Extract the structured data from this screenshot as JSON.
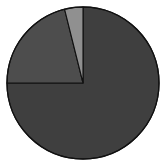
{
  "chart_data": {
    "type": "pie",
    "title": "",
    "subtitle": "",
    "xlabel": "",
    "ylabel": "",
    "grid": false,
    "legend": "none",
    "labels": [
      "Slice 1",
      "Slice 2",
      "Slice 3"
    ],
    "values": [
      75,
      21,
      4
    ],
    "percentages": [
      "75%",
      "21%",
      "4%"
    ],
    "colors": [
      "#3f3f3f",
      "#4d4d4d",
      "#909090"
    ],
    "start_angle_deg": 180,
    "direction": "clockwise",
    "slices": [
      {
        "name": "Slice 1",
        "value": 75,
        "percent": "75%",
        "color": "#3f3f3f",
        "start_deg": 180,
        "end_deg": 450,
        "sweep_deg": 270
      },
      {
        "name": "Slice 2",
        "value": 21,
        "percent": "21%",
        "color": "#4d4d4d",
        "start_deg": 104,
        "end_deg": 180,
        "sweep_deg": 76
      },
      {
        "name": "Slice 3",
        "value": 4,
        "percent": "4%",
        "color": "#909090",
        "start_deg": 90,
        "end_deg": 104,
        "sweep_deg": 14
      }
    ],
    "geometry": {
      "center_x": 83,
      "center_y": 83,
      "radius": 76
    },
    "outline_color": "#111111",
    "background_color": "#ffffff"
  },
  "figure": {
    "caption": ""
  }
}
